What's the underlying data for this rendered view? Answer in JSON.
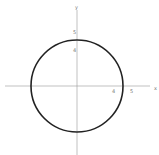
{
  "diagram": {
    "type": "circle-on-coordinate-axes",
    "axes": {
      "x_label": "x",
      "y_label": "y",
      "x_ticks": [
        "4",
        "5"
      ],
      "y_ticks": [
        "5",
        "4"
      ]
    },
    "circle": {
      "center": [
        0,
        0
      ],
      "stroke_color": "#222222"
    },
    "colors": {
      "axis": "#999999",
      "label": "#777777"
    }
  }
}
